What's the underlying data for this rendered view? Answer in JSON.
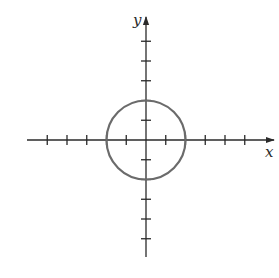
{
  "chart_data": {
    "type": "line",
    "title": "",
    "xlabel": "x",
    "ylabel": "y",
    "xlim": [
      -5.5,
      6.5
    ],
    "ylim": [
      -6,
      6
    ],
    "x_ticks": [
      -5,
      -4,
      -3,
      -2,
      -1,
      1,
      2,
      3,
      4,
      5
    ],
    "y_ticks": [
      -5,
      -4,
      -3,
      -2,
      -1,
      1,
      2,
      3,
      4,
      5
    ],
    "tick_labels_shown": false,
    "grid": false,
    "legend": null,
    "series": [
      {
        "name": "circle",
        "shape": "circle",
        "center": [
          0,
          0
        ],
        "radius": 2,
        "equation": "x^2 + y^2 = 4",
        "intercepts": [
          [
            2,
            0
          ],
          [
            -2,
            0
          ],
          [
            0,
            2
          ],
          [
            0,
            -2
          ]
        ],
        "color": "#6b6b6b"
      }
    ]
  },
  "axes": {
    "x_label": "x",
    "y_label": "y",
    "color": "#2a2a2a"
  }
}
